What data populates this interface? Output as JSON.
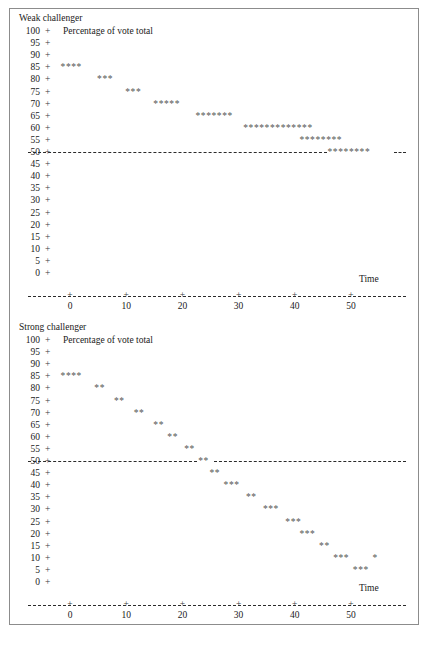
{
  "figure": {
    "axis_tick_glyph": "+",
    "axis_dash_glyph": "-",
    "star_glyph": "*",
    "colors": {
      "frame": "#8c8c8c",
      "text": "#1a1a1a",
      "star": "#555555",
      "axis": "#2b2b2b",
      "background": "#ffffff"
    }
  },
  "panels": [
    {
      "title": "Weak challenger",
      "caption": "Percentage of vote total",
      "xlabel": "Time",
      "y_ticks": [
        100,
        95,
        90,
        85,
        80,
        75,
        70,
        65,
        60,
        55,
        50,
        45,
        40,
        35,
        30,
        25,
        20,
        15,
        10,
        5,
        0
      ],
      "x_ticks": [
        0,
        10,
        20,
        30,
        40,
        50
      ],
      "reference_value": 50
    },
    {
      "title": "Strong challenger",
      "caption": "Percentage of vote total",
      "xlabel": "Time",
      "y_ticks": [
        100,
        95,
        90,
        85,
        80,
        75,
        70,
        65,
        60,
        55,
        50,
        45,
        40,
        35,
        30,
        25,
        20,
        15,
        10,
        5,
        0
      ],
      "x_ticks": [
        0,
        10,
        20,
        30,
        40,
        50
      ],
      "reference_value": 50
    }
  ],
  "chart_data": [
    {
      "type": "scatter",
      "title": "Weak challenger",
      "xlabel": "Time",
      "ylabel": "Percentage of vote total",
      "xlim": [
        -5,
        56
      ],
      "ylim": [
        0,
        100
      ],
      "yticks": [
        0,
        5,
        10,
        15,
        20,
        25,
        30,
        35,
        40,
        45,
        50,
        55,
        60,
        65,
        70,
        75,
        80,
        85,
        90,
        95,
        100
      ],
      "xticks": [
        0,
        10,
        20,
        30,
        40,
        50
      ],
      "grid": false,
      "legend": "none",
      "reference_line": {
        "y": 50,
        "style": "dashed"
      },
      "marker": "*",
      "series": [
        {
          "name": "Incumbent vote share",
          "points": [
            {
              "x": -1.5,
              "y": 85
            },
            {
              "x": 0.0,
              "y": 85
            },
            {
              "x": 1.5,
              "y": 85
            },
            {
              "x": 3.0,
              "y": 85
            },
            {
              "x": 5.0,
              "y": 80
            },
            {
              "x": 6.5,
              "y": 80
            },
            {
              "x": 8.0,
              "y": 80
            },
            {
              "x": 10.0,
              "y": 75
            },
            {
              "x": 11.5,
              "y": 75
            },
            {
              "x": 13.0,
              "y": 75
            },
            {
              "x": 15.0,
              "y": 70
            },
            {
              "x": 16.5,
              "y": 70
            },
            {
              "x": 18.0,
              "y": 70
            },
            {
              "x": 19.5,
              "y": 70
            },
            {
              "x": 21.0,
              "y": 70
            },
            {
              "x": 22.5,
              "y": 65
            },
            {
              "x": 24.0,
              "y": 65
            },
            {
              "x": 25.5,
              "y": 65
            },
            {
              "x": 27.0,
              "y": 65
            },
            {
              "x": 28.5,
              "y": 65
            },
            {
              "x": 30.0,
              "y": 65
            },
            {
              "x": 31.5,
              "y": 65
            },
            {
              "x": 31.0,
              "y": 60
            },
            {
              "x": 32.5,
              "y": 60
            },
            {
              "x": 34.0,
              "y": 60
            },
            {
              "x": 35.5,
              "y": 60
            },
            {
              "x": 37.0,
              "y": 60
            },
            {
              "x": 38.5,
              "y": 60
            },
            {
              "x": 40.0,
              "y": 60
            },
            {
              "x": 41.5,
              "y": 60
            },
            {
              "x": 43.0,
              "y": 60
            },
            {
              "x": 44.5,
              "y": 60
            },
            {
              "x": 46.0,
              "y": 60
            },
            {
              "x": 47.5,
              "y": 60
            },
            {
              "x": 49.0,
              "y": 60
            },
            {
              "x": 41.0,
              "y": 55
            },
            {
              "x": 42.5,
              "y": 55
            },
            {
              "x": 44.0,
              "y": 55
            },
            {
              "x": 45.5,
              "y": 55
            },
            {
              "x": 47.0,
              "y": 55
            },
            {
              "x": 48.5,
              "y": 55
            },
            {
              "x": 50.0,
              "y": 55
            },
            {
              "x": 51.5,
              "y": 55
            },
            {
              "x": 46.0,
              "y": 50
            },
            {
              "x": 47.5,
              "y": 50
            },
            {
              "x": 49.0,
              "y": 50
            },
            {
              "x": 50.5,
              "y": 50
            },
            {
              "x": 52.0,
              "y": 50
            },
            {
              "x": 53.5,
              "y": 50
            },
            {
              "x": 55.0,
              "y": 50
            },
            {
              "x": 56.5,
              "y": 50
            }
          ]
        }
      ],
      "rows": [
        {
          "y": 85,
          "count": 4
        },
        {
          "y": 80,
          "count": 3
        },
        {
          "y": 75,
          "count": 3
        },
        {
          "y": 70,
          "count": 5
        },
        {
          "y": 65,
          "count": 7
        },
        {
          "y": 60,
          "count": 13
        },
        {
          "y": 55,
          "count": 8
        },
        {
          "y": 50,
          "count": 8
        }
      ]
    },
    {
      "type": "scatter",
      "title": "Strong challenger",
      "xlabel": "Time",
      "ylabel": "Percentage of vote total",
      "xlim": [
        -5,
        56
      ],
      "ylim": [
        0,
        100
      ],
      "yticks": [
        0,
        5,
        10,
        15,
        20,
        25,
        30,
        35,
        40,
        45,
        50,
        55,
        60,
        65,
        70,
        75,
        80,
        85,
        90,
        95,
        100
      ],
      "xticks": [
        0,
        10,
        20,
        30,
        40,
        50
      ],
      "grid": false,
      "legend": "none",
      "reference_line": {
        "y": 50,
        "style": "dashed"
      },
      "marker": "*",
      "series": [
        {
          "name": "Incumbent vote share",
          "points": [
            {
              "x": -1.5,
              "y": 85
            },
            {
              "x": 0.0,
              "y": 85
            },
            {
              "x": 1.5,
              "y": 85
            },
            {
              "x": 3.0,
              "y": 85
            },
            {
              "x": 4.5,
              "y": 80
            },
            {
              "x": 6.0,
              "y": 80
            },
            {
              "x": 8.0,
              "y": 75
            },
            {
              "x": 9.5,
              "y": 75
            },
            {
              "x": 11.5,
              "y": 70
            },
            {
              "x": 13.0,
              "y": 70
            },
            {
              "x": 15.0,
              "y": 65
            },
            {
              "x": 16.5,
              "y": 65
            },
            {
              "x": 17.5,
              "y": 60
            },
            {
              "x": 19.0,
              "y": 60
            },
            {
              "x": 20.5,
              "y": 55
            },
            {
              "x": 22.0,
              "y": 55
            },
            {
              "x": 23.0,
              "y": 50
            },
            {
              "x": 24.5,
              "y": 50
            },
            {
              "x": 25.0,
              "y": 45
            },
            {
              "x": 26.5,
              "y": 45
            },
            {
              "x": 27.5,
              "y": 40
            },
            {
              "x": 29.0,
              "y": 40
            },
            {
              "x": 30.5,
              "y": 40
            },
            {
              "x": 31.5,
              "y": 35
            },
            {
              "x": 33.0,
              "y": 35
            },
            {
              "x": 34.5,
              "y": 30
            },
            {
              "x": 36.0,
              "y": 30
            },
            {
              "x": 37.5,
              "y": 30
            },
            {
              "x": 38.5,
              "y": 25
            },
            {
              "x": 40.0,
              "y": 25
            },
            {
              "x": 41.5,
              "y": 25
            },
            {
              "x": 41.0,
              "y": 20
            },
            {
              "x": 42.5,
              "y": 20
            },
            {
              "x": 44.0,
              "y": 20
            },
            {
              "x": 44.5,
              "y": 15
            },
            {
              "x": 46.0,
              "y": 15
            },
            {
              "x": 47.0,
              "y": 10
            },
            {
              "x": 48.5,
              "y": 10
            },
            {
              "x": 50.0,
              "y": 10
            },
            {
              "x": 54.0,
              "y": 10
            },
            {
              "x": 50.5,
              "y": 5
            },
            {
              "x": 52.0,
              "y": 5
            },
            {
              "x": 53.5,
              "y": 5
            }
          ]
        }
      ],
      "rows": [
        {
          "y": 85,
          "count": 4
        },
        {
          "y": 80,
          "count": 2
        },
        {
          "y": 75,
          "count": 2
        },
        {
          "y": 70,
          "count": 2
        },
        {
          "y": 65,
          "count": 2
        },
        {
          "y": 60,
          "count": 2
        },
        {
          "y": 55,
          "count": 2
        },
        {
          "y": 50,
          "count": 2
        },
        {
          "y": 45,
          "count": 2
        },
        {
          "y": 40,
          "count": 3
        },
        {
          "y": 35,
          "count": 2
        },
        {
          "y": 30,
          "count": 3
        },
        {
          "y": 25,
          "count": 3
        },
        {
          "y": 20,
          "count": 3
        },
        {
          "y": 15,
          "count": 2
        },
        {
          "y": 10,
          "count": 3
        },
        {
          "y": 10.1,
          "count": 1
        },
        {
          "y": 5,
          "count": 3
        }
      ]
    }
  ]
}
